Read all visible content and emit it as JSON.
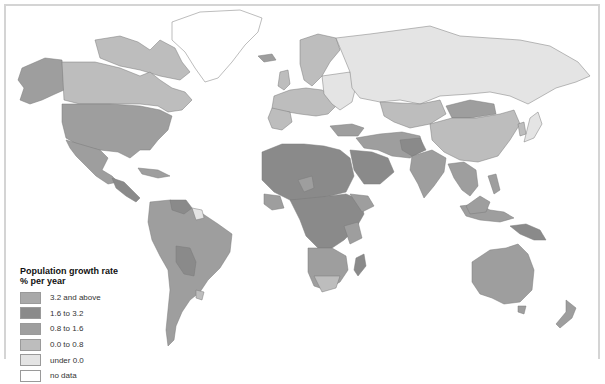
{
  "map": {
    "type": "choropleth",
    "subject": "World population growth rate by country"
  },
  "legend": {
    "title_line1": "Population growth rate",
    "title_line2": "% per year",
    "items": [
      {
        "label": "3.2 and above",
        "color": "#a9a9a9"
      },
      {
        "label": "1.6 to 3.2",
        "color": "#8a8a8a"
      },
      {
        "label": "0.8 to 1.6",
        "color": "#9e9e9e"
      },
      {
        "label": "0.0 to 0.8",
        "color": "#bdbdbd"
      },
      {
        "label": "under 0.0",
        "color": "#e4e4e4"
      },
      {
        "label": "no data",
        "color": "#ffffff"
      }
    ]
  }
}
